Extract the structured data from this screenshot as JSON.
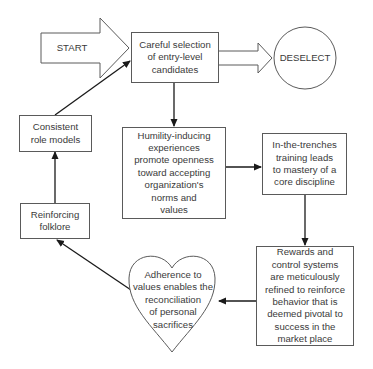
{
  "diagram": {
    "type": "flowchart-cycle",
    "nodes": {
      "start": {
        "label": "START",
        "shape": "block-arrow"
      },
      "selection": {
        "label": "Careful selection\nof entry-level\ncandidates",
        "shape": "rectangle"
      },
      "deselect": {
        "label": "DESELECT",
        "shape": "circle"
      },
      "humility": {
        "label": "Humility-inducing\nexperiences\npromote openness\ntoward accepting\norganization's\nnorms and\nvalues",
        "shape": "rectangle"
      },
      "trenches": {
        "label": "In-the-trenches\ntraining leads\nto mastery of a\ncore discipline",
        "shape": "rectangle"
      },
      "rewards": {
        "label": "Rewards and\ncontrol systems\nare meticulously\nrefined to reinforce\nbehavior that is\ndeemed pivotal to\nsuccess in the\nmarket place",
        "shape": "rectangle"
      },
      "adherence": {
        "label": "Adherence to\nvalues enables the\nreconciliation\nof personal\nsacrifices",
        "shape": "heart"
      },
      "folklore": {
        "label": "Reinforcing\nfolklore",
        "shape": "rectangle"
      },
      "role_models": {
        "label": "Consistent\nrole models",
        "shape": "rectangle"
      }
    },
    "edges": [
      {
        "from": "start",
        "to": "selection",
        "style": "block-arrow"
      },
      {
        "from": "selection",
        "to": "deselect",
        "style": "hollow-double-arrow"
      },
      {
        "from": "selection",
        "to": "humility",
        "style": "arrow"
      },
      {
        "from": "humility",
        "to": "trenches",
        "style": "arrow"
      },
      {
        "from": "trenches",
        "to": "rewards",
        "style": "arrow"
      },
      {
        "from": "rewards",
        "to": "adherence",
        "style": "arrow"
      },
      {
        "from": "adherence",
        "to": "folklore",
        "style": "arrow"
      },
      {
        "from": "folklore",
        "to": "role_models",
        "style": "arrow"
      },
      {
        "from": "role_models",
        "to": "selection",
        "style": "arrow"
      }
    ],
    "colors": {
      "line": "#5a5a5a",
      "arrow": "#1a1a1a",
      "text": "#3a3a3a",
      "background": "#ffffff"
    }
  }
}
